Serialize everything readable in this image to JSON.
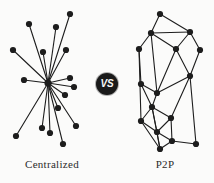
{
  "figure": {
    "background_color": "#fbfbfa",
    "ink_color": "#1d1d1d",
    "badge": {
      "label": "VS",
      "shape": "circle",
      "fill_color": "#1a1a1a",
      "text_color": "#f6f6f6",
      "cx": 107,
      "cy": 84,
      "r": 11
    },
    "captions": {
      "left": "Centralized",
      "right": "P2P"
    }
  },
  "chart_data": [
    {
      "type": "diagram",
      "name": "centralized-network",
      "title": "Centralized",
      "layout": "star",
      "node_radius": 3.1,
      "edge_width": 1.1,
      "hub": {
        "id": "hub",
        "x": 48,
        "y": 83
      },
      "nodes": [
        {
          "id": "n1",
          "x": 29,
          "y": 24
        },
        {
          "id": "n2",
          "x": 56,
          "y": 27
        },
        {
          "id": "n3",
          "x": 70,
          "y": 14
        },
        {
          "id": "n4",
          "x": 13,
          "y": 50
        },
        {
          "id": "n5",
          "x": 43,
          "y": 52
        },
        {
          "id": "n6",
          "x": 66,
          "y": 50
        },
        {
          "id": "n7",
          "x": 24,
          "y": 80
        },
        {
          "id": "n8",
          "x": 70,
          "y": 78
        },
        {
          "id": "n9",
          "x": 74,
          "y": 87
        },
        {
          "id": "n10",
          "x": 65,
          "y": 95
        },
        {
          "id": "n11",
          "x": 58,
          "y": 108
        },
        {
          "id": "n12",
          "x": 16,
          "y": 136
        },
        {
          "id": "n13",
          "x": 42,
          "y": 128
        },
        {
          "id": "n14",
          "x": 50,
          "y": 133
        },
        {
          "id": "n15",
          "x": 63,
          "y": 144
        },
        {
          "id": "n16",
          "x": 76,
          "y": 126
        }
      ],
      "edges": [
        [
          "hub",
          "n1"
        ],
        [
          "hub",
          "n2"
        ],
        [
          "hub",
          "n3"
        ],
        [
          "hub",
          "n4"
        ],
        [
          "hub",
          "n5"
        ],
        [
          "hub",
          "n6"
        ],
        [
          "hub",
          "n7"
        ],
        [
          "hub",
          "n8"
        ],
        [
          "hub",
          "n9"
        ],
        [
          "hub",
          "n10"
        ],
        [
          "hub",
          "n11"
        ],
        [
          "hub",
          "n12"
        ],
        [
          "hub",
          "n13"
        ],
        [
          "hub",
          "n14"
        ],
        [
          "hub",
          "n15"
        ],
        [
          "hub",
          "n16"
        ]
      ],
      "node_count": 17,
      "edge_count": 16
    },
    {
      "type": "diagram",
      "name": "p2p-network",
      "title": "P2P",
      "layout": "mesh",
      "node_radius": 3.1,
      "edge_width": 1.1,
      "nodes": [
        {
          "id": "p1",
          "x": 160,
          "y": 14
        },
        {
          "id": "p2",
          "x": 151,
          "y": 33
        },
        {
          "id": "p3",
          "x": 190,
          "y": 32
        },
        {
          "id": "p4",
          "x": 139,
          "y": 49
        },
        {
          "id": "p5",
          "x": 176,
          "y": 49
        },
        {
          "id": "p6",
          "x": 200,
          "y": 50
        },
        {
          "id": "p7",
          "x": 190,
          "y": 76
        },
        {
          "id": "p8",
          "x": 141,
          "y": 84
        },
        {
          "id": "p9",
          "x": 157,
          "y": 93
        },
        {
          "id": "p10",
          "x": 152,
          "y": 107
        },
        {
          "id": "p11",
          "x": 141,
          "y": 121
        },
        {
          "id": "p12",
          "x": 171,
          "y": 118
        },
        {
          "id": "p13",
          "x": 157,
          "y": 132
        },
        {
          "id": "p14",
          "x": 172,
          "y": 141
        },
        {
          "id": "p15",
          "x": 160,
          "y": 149
        },
        {
          "id": "p16",
          "x": 196,
          "y": 144
        }
      ],
      "edges": [
        [
          "p1",
          "p2"
        ],
        [
          "p1",
          "p3"
        ],
        [
          "p2",
          "p3"
        ],
        [
          "p2",
          "p4"
        ],
        [
          "p2",
          "p5"
        ],
        [
          "p2",
          "p9"
        ],
        [
          "p3",
          "p5"
        ],
        [
          "p3",
          "p6"
        ],
        [
          "p4",
          "p8"
        ],
        [
          "p4",
          "p11"
        ],
        [
          "p5",
          "p7"
        ],
        [
          "p5",
          "p9"
        ],
        [
          "p6",
          "p7"
        ],
        [
          "p7",
          "p9"
        ],
        [
          "p7",
          "p12"
        ],
        [
          "p7",
          "p16"
        ],
        [
          "p8",
          "p9"
        ],
        [
          "p8",
          "p10"
        ],
        [
          "p9",
          "p10"
        ],
        [
          "p10",
          "p11"
        ],
        [
          "p10",
          "p12"
        ],
        [
          "p10",
          "p13"
        ],
        [
          "p10",
          "p15"
        ],
        [
          "p11",
          "p13"
        ],
        [
          "p11",
          "p15"
        ],
        [
          "p12",
          "p13"
        ],
        [
          "p12",
          "p14"
        ],
        [
          "p13",
          "p14"
        ],
        [
          "p13",
          "p15"
        ],
        [
          "p14",
          "p15"
        ],
        [
          "p14",
          "p16"
        ]
      ],
      "node_count": 16,
      "edge_count": 31
    }
  ]
}
